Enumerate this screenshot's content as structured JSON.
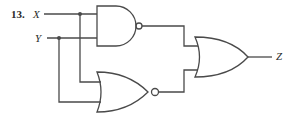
{
  "problem": {
    "number": "13.",
    "inputs": [
      {
        "name": "X"
      },
      {
        "name": "Y"
      }
    ],
    "output": {
      "name": "Z"
    }
  },
  "gates": [
    {
      "id": "g1",
      "type": "NAND",
      "inputs": [
        "X",
        "Y"
      ]
    },
    {
      "id": "g2",
      "type": "NOR",
      "inputs": [
        "X",
        "Y"
      ]
    },
    {
      "id": "g3",
      "type": "OR",
      "inputs": [
        "g1",
        "g2"
      ],
      "output": "Z"
    }
  ],
  "colors": {
    "line": "#4a4a4a",
    "text": "#2a2a2a",
    "background": "#ffffff"
  }
}
